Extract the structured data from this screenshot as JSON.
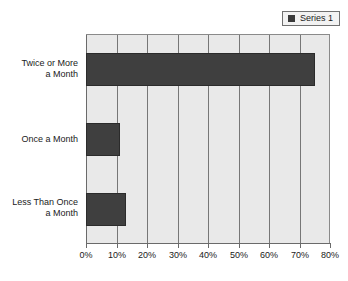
{
  "chart_data": {
    "type": "bar",
    "orientation": "horizontal",
    "title": "",
    "subtitle": "",
    "xlabel": "",
    "ylabel": "",
    "categories": [
      "Twice or More\na Month",
      "Once a Month",
      "Less Than Once\na Month"
    ],
    "values": [
      75,
      11,
      13
    ],
    "series": [
      {
        "name": "Series 1",
        "values": [
          75,
          11,
          13
        ],
        "color": "#3f3f3f"
      }
    ],
    "xlim": [
      0,
      80
    ],
    "xtick_values": [
      0,
      10,
      20,
      30,
      40,
      50,
      60,
      70,
      80
    ],
    "xtick_labels": [
      "0%",
      "10%",
      "20%",
      "30%",
      "40%",
      "50%",
      "60%",
      "70%",
      "80%"
    ],
    "grid": true,
    "grid_axis": "x",
    "legend_position": "top-right",
    "plot_background": "#e9e9e9",
    "gridline_color": "#777777",
    "axis_color": "#6a6a6a"
  },
  "legend": {
    "entries": [
      {
        "label": "Series 1",
        "swatch_icon": "legend-square-icon",
        "color": "#3f3f3f"
      }
    ]
  }
}
